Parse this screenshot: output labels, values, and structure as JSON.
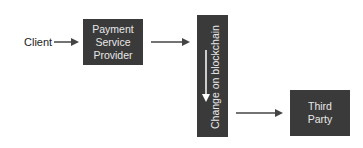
{
  "diagram": {
    "type": "flow",
    "nodes": {
      "client": {
        "label": "Client"
      },
      "psp": {
        "label": "Payment\nService\nProvider"
      },
      "blockchain": {
        "label": "Change on blockchain"
      },
      "third_party": {
        "label": "Third\nParty"
      }
    },
    "edges": [
      {
        "from": "Client",
        "to": "Payment Service Provider"
      },
      {
        "from": "Payment Service Provider",
        "to": "Change on blockchain"
      },
      {
        "from": "Change on blockchain",
        "to": "Third Party"
      }
    ],
    "colors": {
      "box_fill": "#3a3a3a",
      "box_text": "#e8e8e8",
      "arrow": "#444444",
      "inner_arrow": "#ffffff",
      "background": "#ffffff"
    }
  }
}
